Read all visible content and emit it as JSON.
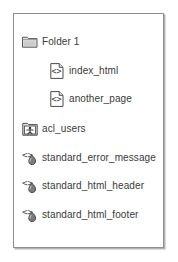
{
  "panel": {
    "name": "object-listing-panel",
    "background_color": "#ffffff",
    "border_color": "#8e8e8e",
    "shadow_color": "#b4b4b4"
  },
  "listing": {
    "items": [
      {
        "label": "Folder 1",
        "icon": "folder-icon",
        "indent": 0,
        "type": "folder"
      },
      {
        "label": "index_html",
        "icon": "html-document-icon",
        "indent": 1,
        "type": "dtml-document"
      },
      {
        "label": "another_page",
        "icon": "html-document-icon",
        "indent": 1,
        "type": "dtml-document"
      },
      {
        "label": "acl_users",
        "icon": "user-folder-icon",
        "indent": 0,
        "type": "user-folder"
      },
      {
        "label": "standard_error_message",
        "icon": "dtml-method-icon",
        "indent": 0,
        "type": "dtml-method"
      },
      {
        "label": "standard_html_header",
        "icon": "dtml-method-icon",
        "indent": 0,
        "type": "dtml-method"
      },
      {
        "label": "standard_html_footer",
        "icon": "dtml-method-icon",
        "indent": 0,
        "type": "dtml-method"
      }
    ]
  },
  "colors": {
    "text": "#3a3a3a",
    "icon_outline": "#4a4a4a",
    "icon_fill_light": "#e2e2e2",
    "icon_fill_mid": "#b9b9b9",
    "icon_fill_dark": "#6e6e6e"
  }
}
